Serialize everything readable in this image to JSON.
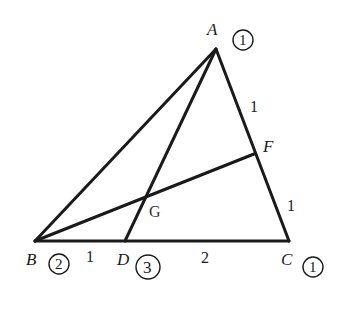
{
  "diagram": {
    "type": "triangle-cevians",
    "vertices": {
      "A": {
        "label": "A",
        "x": 216,
        "y": 49,
        "weight": "1"
      },
      "B": {
        "label": "B",
        "x": 35,
        "y": 241,
        "weight": "2"
      },
      "C": {
        "label": "C",
        "x": 289,
        "y": 241,
        "weight": "1"
      },
      "D": {
        "label": "D",
        "x": 125,
        "y": 241,
        "weight": "3"
      },
      "F": {
        "label": "F",
        "x": 254,
        "y": 154
      },
      "G": {
        "label": "G",
        "x": 147,
        "y": 199
      }
    },
    "segments": [
      {
        "from": "A",
        "to": "B"
      },
      {
        "from": "A",
        "to": "C"
      },
      {
        "from": "B",
        "to": "C"
      },
      {
        "from": "A",
        "to": "D"
      },
      {
        "from": "B",
        "to": "F"
      }
    ],
    "length_labels": {
      "BD": "1",
      "DC": "2",
      "AF": "1",
      "FC": "1"
    },
    "colors": {
      "stroke": "#1a1a1a",
      "background": "#ffffff"
    }
  }
}
